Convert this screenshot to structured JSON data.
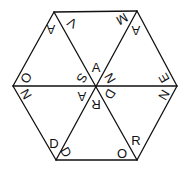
{
  "diagram": {
    "type": "hexagon-letter-puzzle",
    "colors": {
      "line": "#111111",
      "text": "#111111",
      "background": "#ffffff"
    },
    "vertices": {
      "top_left": [
        54,
        12
      ],
      "top_right": [
        137,
        11
      ],
      "right": [
        177,
        86
      ],
      "bottom_right": [
        137,
        160
      ],
      "bottom_left": [
        56,
        160
      ],
      "left": [
        13,
        86
      ],
      "center": [
        96,
        86
      ]
    },
    "letters": [
      {
        "id": "top-left-apex",
        "char": "A",
        "x": 51,
        "y": 29,
        "rotate": 180
      },
      {
        "id": "top-left-inner",
        "char": "V",
        "x": 72,
        "y": 23,
        "rotate": 210
      },
      {
        "id": "top-right-inner",
        "char": "M",
        "x": 122,
        "y": 19,
        "rotate": 150
      },
      {
        "id": "top-right-apex",
        "char": "A",
        "x": 136,
        "y": 30,
        "rotate": 180
      },
      {
        "id": "center-top",
        "char": "A",
        "x": 96,
        "y": 67,
        "rotate": 0
      },
      {
        "id": "center-upper-left",
        "char": "S",
        "x": 82,
        "y": 78,
        "rotate": 120
      },
      {
        "id": "center-upper-right",
        "char": "N",
        "x": 110,
        "y": 78,
        "rotate": 60
      },
      {
        "id": "center-lower-left",
        "char": "A",
        "x": 82,
        "y": 96,
        "rotate": 180
      },
      {
        "id": "center-bottom",
        "char": "R",
        "x": 96,
        "y": 104,
        "rotate": 180
      },
      {
        "id": "center-lower-right",
        "char": "D",
        "x": 110,
        "y": 94,
        "rotate": 120
      },
      {
        "id": "left-upper",
        "char": "O",
        "x": 26,
        "y": 78,
        "rotate": 120
      },
      {
        "id": "left-lower",
        "char": "N",
        "x": 26,
        "y": 94,
        "rotate": 60
      },
      {
        "id": "right-upper",
        "char": "E",
        "x": 164,
        "y": 78,
        "rotate": 240
      },
      {
        "id": "right-lower",
        "char": "N",
        "x": 164,
        "y": 95,
        "rotate": 300
      },
      {
        "id": "bottom-left-inner",
        "char": "D",
        "x": 54,
        "y": 143,
        "rotate": 0
      },
      {
        "id": "bottom-left-apex",
        "char": "D",
        "x": 66,
        "y": 152,
        "rotate": 60
      },
      {
        "id": "bottom-right-apex",
        "char": "O",
        "x": 122,
        "y": 153,
        "rotate": 0
      },
      {
        "id": "bottom-right-inner",
        "char": "R",
        "x": 136,
        "y": 140,
        "rotate": 0
      }
    ]
  }
}
